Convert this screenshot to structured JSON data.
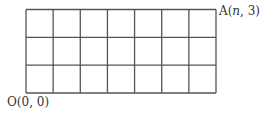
{
  "diagram": {
    "type": "grid",
    "columns": 7,
    "rows": 3,
    "line_color": "#555555",
    "labels": {
      "top_right": {
        "prefix": "A(",
        "var": "n",
        "suffix": ", 3)"
      },
      "bottom_left": "O(0, 0)"
    }
  }
}
